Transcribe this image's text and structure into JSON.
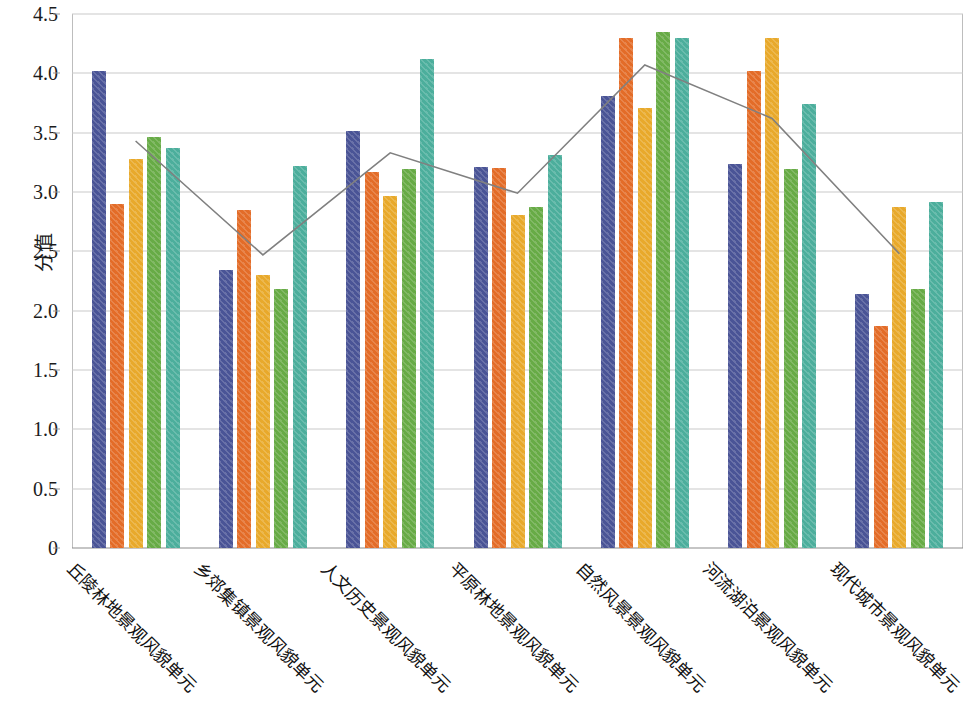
{
  "chart_data": {
    "type": "bar",
    "title": "",
    "subtitle": "",
    "xlabel": "",
    "ylabel": "分值",
    "ylim": [
      0,
      4.5
    ],
    "grid": true,
    "legend": "none",
    "y_ticks": [
      "4.5",
      "4.0",
      "3.5",
      "3.0",
      "2.5",
      "2.0",
      "1.5",
      "1.0",
      "0.5",
      "0"
    ],
    "y_tick_values": [
      4.5,
      4.0,
      3.5,
      3.0,
      2.5,
      2.0,
      1.5,
      1.0,
      0.5,
      0
    ],
    "categories": [
      "丘陵林地景观风貌单元",
      "乡郊集镇景观风貌单元",
      "人文历史景观风貌单元",
      "平原林地景观风貌单元",
      "自然风景景观风貌单元",
      "河流湖泊景观风貌单元",
      "现代城市景观风貌单元"
    ],
    "series": [
      {
        "name": "系列1",
        "color": "#4a5496",
        "values": [
          4.02,
          2.34,
          3.51,
          3.21,
          3.81,
          3.24,
          2.14
        ]
      },
      {
        "name": "系列2",
        "color": "#e36c28",
        "values": [
          2.9,
          2.85,
          3.17,
          3.2,
          4.3,
          4.02,
          1.87
        ]
      },
      {
        "name": "系列3",
        "color": "#e8a92b",
        "values": [
          3.28,
          2.3,
          2.97,
          2.81,
          3.71,
          4.3,
          2.87
        ]
      },
      {
        "name": "系列4",
        "color": "#67ab46",
        "values": [
          3.46,
          2.18,
          3.19,
          2.87,
          4.35,
          3.19,
          2.18
        ]
      },
      {
        "name": "系列5",
        "color": "#4cae9c",
        "values": [
          3.37,
          3.22,
          4.12,
          3.31,
          4.3,
          3.74,
          2.92
        ]
      }
    ],
    "line_series": {
      "name": "折线",
      "color": "#808080",
      "values": [
        3.43,
        2.47,
        3.33,
        2.99,
        4.07,
        3.62,
        2.48
      ]
    }
  }
}
